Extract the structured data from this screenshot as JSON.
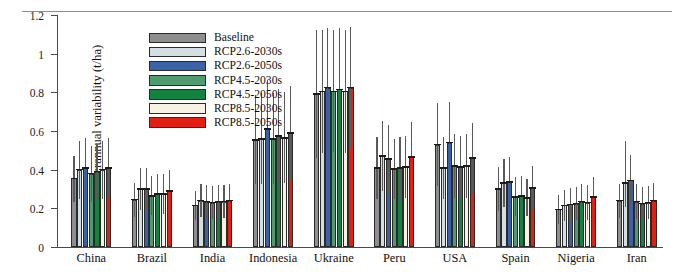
{
  "figure": {
    "divider": "top-horizontal-rule"
  },
  "axes": {
    "ylabel": "Yield interannual variability (t/ha)",
    "yticks": [
      "0",
      "0.2",
      "0.4",
      "0.6",
      "0.8",
      "1",
      "1.2"
    ],
    "ytick_values": [
      0,
      0.2,
      0.4,
      0.6,
      0.8,
      1.0,
      1.2
    ],
    "ymin": 0,
    "ymax": 1.2
  },
  "legend": {
    "position": "top-left-inside",
    "items": [
      {
        "label": "Baseline",
        "color": "#8e8e8e"
      },
      {
        "label": "RCP2.6-2030s",
        "color": "#d3dfe2"
      },
      {
        "label": "RCP2.6-2050s",
        "color": "#3a62a8"
      },
      {
        "label": "RCP4.5-2030s",
        "color": "#4e9b6e"
      },
      {
        "label": "RCP4.5-2050s",
        "color": "#14823f"
      },
      {
        "label": "RCP8.5-2030s",
        "color": "#f7f2e2"
      },
      {
        "label": "RCP8.5-2050s",
        "color": "#e21f10"
      }
    ]
  },
  "chart_data": {
    "type": "bar",
    "title": "",
    "xlabel": "",
    "ylabel": "Yield interannual variability (t/ha)",
    "ylim": [
      0,
      1.2
    ],
    "grid": false,
    "legend_position": "top-left-inside",
    "error_bars": "asymmetric-range",
    "categories": [
      "China",
      "Brazil",
      "India",
      "Indonesia",
      "Ukraine",
      "Peru",
      "USA",
      "Spain",
      "Nigeria",
      "Iran"
    ],
    "series": [
      {
        "name": "Baseline",
        "color": "#8e8e8e",
        "values": [
          0.355,
          0.245,
          0.215,
          0.555,
          0.79,
          0.41,
          0.53,
          0.3,
          0.195,
          0.24
        ],
        "err_low": [
          0.12,
          0.09,
          0.075,
          0.23,
          0.33,
          0.16,
          0.215,
          0.115,
          0.075,
          0.09
        ],
        "err_high": [
          0.115,
          0.085,
          0.075,
          0.23,
          0.33,
          0.16,
          0.215,
          0.115,
          0.075,
          0.085
        ]
      },
      {
        "name": "RCP2.6-2030s",
        "color": "#d3dfe2",
        "values": [
          0.4,
          0.3,
          0.24,
          0.56,
          0.805,
          0.47,
          0.41,
          0.33,
          0.215,
          0.33
        ],
        "err_low": [
          0.15,
          0.11,
          0.085,
          0.235,
          0.32,
          0.18,
          0.16,
          0.125,
          0.08,
          0.125
        ],
        "err_high": [
          0.15,
          0.11,
          0.085,
          0.235,
          0.32,
          0.18,
          0.16,
          0.125,
          0.08,
          0.22
        ]
      },
      {
        "name": "RCP2.6-2050s",
        "color": "#3a62a8",
        "values": [
          0.41,
          0.3,
          0.235,
          0.61,
          0.825,
          0.455,
          0.54,
          0.335,
          0.22,
          0.345
        ],
        "err_low": [
          0.155,
          0.11,
          0.085,
          0.255,
          0.31,
          0.175,
          0.21,
          0.13,
          0.085,
          0.13
        ],
        "err_high": [
          0.155,
          0.11,
          0.085,
          0.255,
          0.31,
          0.175,
          0.21,
          0.13,
          0.085,
          0.13
        ]
      },
      {
        "name": "RCP4.5-2030s",
        "color": "#4e9b6e",
        "values": [
          0.38,
          0.265,
          0.23,
          0.56,
          0.805,
          0.405,
          0.42,
          0.26,
          0.225,
          0.235
        ],
        "err_low": [
          0.145,
          0.1,
          0.085,
          0.235,
          0.315,
          0.155,
          0.165,
          0.1,
          0.085,
          0.09
        ],
        "err_high": [
          0.145,
          0.1,
          0.085,
          0.235,
          0.315,
          0.155,
          0.165,
          0.1,
          0.085,
          0.09
        ]
      },
      {
        "name": "RCP4.5-2050s",
        "color": "#14823f",
        "values": [
          0.39,
          0.275,
          0.235,
          0.575,
          0.815,
          0.41,
          0.415,
          0.265,
          0.235,
          0.225
        ],
        "err_low": [
          0.145,
          0.105,
          0.085,
          0.24,
          0.32,
          0.16,
          0.16,
          0.1,
          0.09,
          0.085
        ],
        "err_high": [
          0.145,
          0.105,
          0.085,
          0.24,
          0.32,
          0.16,
          0.16,
          0.1,
          0.09,
          0.085
        ]
      },
      {
        "name": "RCP8.5-2030s",
        "color": "#f7f2e2",
        "values": [
          0.4,
          0.275,
          0.235,
          0.565,
          0.805,
          0.415,
          0.42,
          0.255,
          0.23,
          0.23
        ],
        "err_low": [
          0.15,
          0.105,
          0.085,
          0.235,
          0.32,
          0.16,
          0.165,
          0.095,
          0.09,
          0.085
        ],
        "err_high": [
          0.15,
          0.105,
          0.085,
          0.235,
          0.32,
          0.16,
          0.165,
          0.095,
          0.09,
          0.085
        ]
      },
      {
        "name": "RCP8.5-2050s",
        "color": "#e21f10",
        "values": [
          0.41,
          0.29,
          0.24,
          0.59,
          0.825,
          0.465,
          0.46,
          0.305,
          0.26,
          0.24
        ],
        "err_low": [
          0.155,
          0.11,
          0.085,
          0.245,
          0.315,
          0.18,
          0.18,
          0.115,
          0.1,
          0.09
        ],
        "err_high": [
          0.155,
          0.11,
          0.085,
          0.245,
          0.315,
          0.18,
          0.18,
          0.115,
          0.1,
          0.09
        ]
      }
    ]
  }
}
